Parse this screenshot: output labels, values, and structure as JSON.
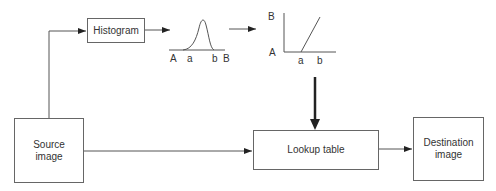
{
  "diagram": {
    "nodes": {
      "histogram": {
        "label": "Histogram"
      },
      "source": {
        "label_line1": "Source",
        "label_line2": "image"
      },
      "lookup": {
        "label": "Lookup table"
      },
      "destination": {
        "label_line1": "Destination",
        "label_line2": "image"
      }
    },
    "histogram_plot": {
      "labels": {
        "A": "A",
        "a": "a",
        "b": "b",
        "B": "B"
      }
    },
    "mapping_plot": {
      "labels": {
        "B": "B",
        "A": "A",
        "a": "a",
        "b": "b"
      }
    },
    "edges": [
      {
        "from": "source",
        "to": "histogram"
      },
      {
        "from": "histogram",
        "to": "histogram_plot"
      },
      {
        "from": "histogram_plot",
        "to": "mapping_plot"
      },
      {
        "from": "mapping_plot",
        "to": "lookup",
        "style": "thick"
      },
      {
        "from": "source",
        "to": "lookup"
      },
      {
        "from": "lookup",
        "to": "destination"
      }
    ],
    "colors": {
      "line": "#555555",
      "thick_arrow": "#222222",
      "text": "#333333"
    }
  }
}
